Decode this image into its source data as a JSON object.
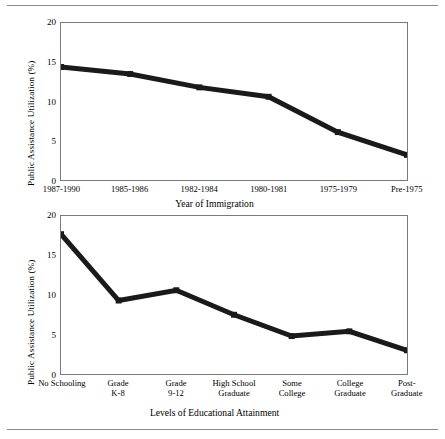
{
  "chart_data": [
    {
      "type": "line",
      "id": "immigration",
      "title": "",
      "xlabel": "Year of Immigration",
      "ylabel": "Public Assistance Utilization (%)",
      "categories": [
        "1987-1990",
        "1985-1986",
        "1982-1984",
        "1980-1981",
        "1975-1979",
        "Pre-1975"
      ],
      "values": [
        14.4,
        13.5,
        11.8,
        10.6,
        6.1,
        3.2
      ],
      "ylim": [
        0,
        20
      ],
      "yticks": [
        0,
        5,
        10,
        15,
        20
      ],
      "grid": false,
      "legend": "none",
      "marker": "square",
      "line_color": "#1a1a1a"
    },
    {
      "type": "line",
      "id": "education",
      "title": "",
      "xlabel": "Levels of Educational Attainment",
      "ylabel": "Public Assistance Utilization (%)",
      "categories": [
        "No Schooling",
        "Grade K-8",
        "Grade 9-12",
        "High School Graduate",
        "Some College",
        "College Graduate",
        "Post-Graduate"
      ],
      "category_lines": [
        [
          "No Schooling",
          ""
        ],
        [
          "Grade",
          "K-8"
        ],
        [
          "Grade",
          "9-12"
        ],
        [
          "High School",
          "Graduate"
        ],
        [
          "Some",
          "College"
        ],
        [
          "College",
          "Graduate"
        ],
        [
          "Post-",
          "Graduate"
        ]
      ],
      "values": [
        17.7,
        9.3,
        10.6,
        7.5,
        4.8,
        5.4,
        3.0
      ],
      "ylim": [
        0,
        20
      ],
      "yticks": [
        0,
        5,
        10,
        15,
        20
      ],
      "grid": false,
      "legend": "none",
      "marker": "square",
      "line_color": "#1a1a1a"
    }
  ],
  "charts": {
    "top": {
      "ylabel": "Public Assistance Utilization (%)",
      "xlabel": "Year of Immigration"
    },
    "bottom": {
      "ylabel": "Public Assistance Utilization (%)",
      "xlabel": "Levels of Educational Attainment"
    }
  }
}
